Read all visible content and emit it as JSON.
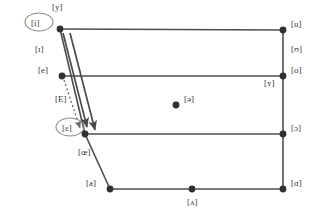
{
  "chart_data": {
    "type": "scatter",
    "title": "",
    "subtitle": "",
    "xlabel": "",
    "ylabel": "",
    "xlim": [
      0,
      314
    ],
    "ylim": [
      0,
      222
    ],
    "grid": false,
    "legend": false,
    "vowels": [
      {
        "id": "i",
        "label": "[i]",
        "x": 60,
        "y": 29,
        "dot": true,
        "circled": true,
        "label_dx": -29,
        "label_dy": -5
      },
      {
        "id": "y",
        "label": "[y]",
        "x": 60,
        "y": 29,
        "dot": false,
        "circled": false,
        "label_dx": -8,
        "label_dy": -21
      },
      {
        "id": "u",
        "label": "[u]",
        "x": 283,
        "y": 30,
        "dot": true,
        "circled": false,
        "label_dx": 8,
        "label_dy": -5
      },
      {
        "id": "upsilon",
        "label": "[ʊ]",
        "x": 283,
        "y": 55,
        "dot": false,
        "circled": false,
        "label_dx": 8,
        "label_dy": -5
      },
      {
        "id": "small-i",
        "label": "[ɪ]",
        "x": 40,
        "y": 55,
        "dot": false,
        "circled": false,
        "label_dx": -5,
        "label_dy": -5
      },
      {
        "id": "e",
        "label": "[e]",
        "x": 62,
        "y": 76,
        "dot": true,
        "circled": false,
        "label_dx": -24,
        "label_dy": -5
      },
      {
        "id": "o",
        "label": "[o]",
        "x": 283,
        "y": 76,
        "dot": true,
        "circled": false,
        "label_dx": 8,
        "label_dy": -5
      },
      {
        "id": "small-y",
        "label": "[ʏ]",
        "x": 270,
        "y": 89,
        "dot": false,
        "circled": false,
        "label_dx": -6,
        "label_dy": -5
      },
      {
        "id": "cap-e",
        "label": "[E]",
        "x": 60,
        "y": 105,
        "dot": false,
        "circled": false,
        "label_dx": -5,
        "label_dy": -5
      },
      {
        "id": "schwa",
        "label": "[ə]",
        "x": 176,
        "y": 105,
        "dot": true,
        "circled": false,
        "label_dx": 8,
        "label_dy": -5
      },
      {
        "id": "epsilon",
        "label": "[ɛ]",
        "x": 85,
        "y": 134,
        "dot": true,
        "circled": true,
        "label_dx": -23,
        "label_dy": -5
      },
      {
        "id": "oe",
        "label": "[œ]",
        "x": 83,
        "y": 158,
        "dot": false,
        "circled": false,
        "label_dx": -5,
        "label_dy": -5
      },
      {
        "id": "openo",
        "label": "[ɔ]",
        "x": 283,
        "y": 134,
        "dot": true,
        "circled": false,
        "label_dx": 8,
        "label_dy": -5
      },
      {
        "id": "a-front",
        "label": "[a]",
        "x": 110,
        "y": 189,
        "dot": true,
        "circled": false,
        "label_dx": -24,
        "label_dy": -5
      },
      {
        "id": "turnedv",
        "label": "[ʌ]",
        "x": 192,
        "y": 189,
        "dot": true,
        "circled": false,
        "label_dx": -5,
        "label_dy": 14
      },
      {
        "id": "a-back",
        "label": "[ɑ]",
        "x": 283,
        "y": 189,
        "dot": true,
        "circled": false,
        "label_dx": 8,
        "label_dy": -5
      }
    ],
    "quad_edges": [
      {
        "name": "top-edge",
        "x1": 60,
        "y1": 29,
        "x2": 283,
        "y2": 30
      },
      {
        "name": "mid-high-edge",
        "x1": 62,
        "y1": 76,
        "x2": 283,
        "y2": 76
      },
      {
        "name": "mid-low-edge",
        "x1": 85,
        "y1": 134,
        "x2": 283,
        "y2": 134
      },
      {
        "name": "bottom-edge",
        "x1": 110,
        "y1": 189,
        "x2": 283,
        "y2": 189
      },
      {
        "name": "right-edge",
        "x1": 283,
        "y1": 30,
        "x2": 283,
        "y2": 189
      },
      {
        "name": "front-edge-upper",
        "x1": 60,
        "y1": 29,
        "x2": 85,
        "y2": 134
      },
      {
        "name": "front-edge-lower",
        "x1": 85,
        "y1": 134,
        "x2": 110,
        "y2": 189
      }
    ],
    "arrows": [
      {
        "name": "arrow-i-to-epsilon",
        "style": "solid",
        "x1": 63,
        "y1": 33,
        "x2": 87,
        "y2": 127
      },
      {
        "name": "arrow-y-to-epsilon",
        "style": "solid",
        "x1": 70,
        "y1": 33,
        "x2": 95,
        "y2": 130
      },
      {
        "name": "arrow-e-to-epsilon",
        "style": "dotted",
        "x1": 64,
        "y1": 80,
        "x2": 80,
        "y2": 128
      }
    ]
  },
  "meta": {
    "circle_marker_ids": [
      "i",
      "epsilon"
    ]
  }
}
